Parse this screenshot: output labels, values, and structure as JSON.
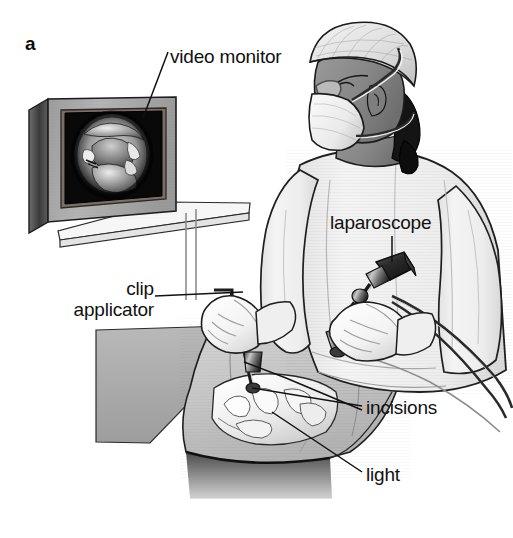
{
  "figure": {
    "panel_letter": "a",
    "caption_subject": "laparoscopic cholecystectomy operating room scene",
    "background_color": "#ffffff",
    "ink_color": "#111111"
  },
  "labels": {
    "video_monitor": "video monitor",
    "laparoscope": "laparoscope",
    "clip_line1": "clip",
    "clip_line2": "applicator",
    "incisions": "incisions",
    "light": "light"
  },
  "scene": {
    "monitor": {
      "name": "video monitor",
      "bezel_color": "#a9a9a9",
      "screen_color": "#0b0b0b",
      "side_color": "#4a4a4a",
      "image_caption": "endoscopic view of gallbladder"
    },
    "shelf": {
      "name": "monitor shelf",
      "color": "#f2f2f2"
    },
    "surgeon": {
      "name": "surgeon",
      "cap": "surgical cap",
      "mask": "surgical mask",
      "glasses": "eyeglasses",
      "hair": "ponytail",
      "gown": "surgical gown",
      "gloves": "surgical gloves",
      "skin_color": "#8c8c8c",
      "gown_color": "#f0f0f0",
      "hair_color": "#141414"
    },
    "patient": {
      "name": "draped patient abdomen",
      "drape_color": "#c9c9c9",
      "skin_color": "#e8e8e8"
    },
    "instruments": [
      {
        "name": "clip applicator",
        "held_by": "right hand"
      },
      {
        "name": "laparoscope",
        "held_by": "left hand"
      },
      {
        "name": "light cable"
      }
    ]
  }
}
